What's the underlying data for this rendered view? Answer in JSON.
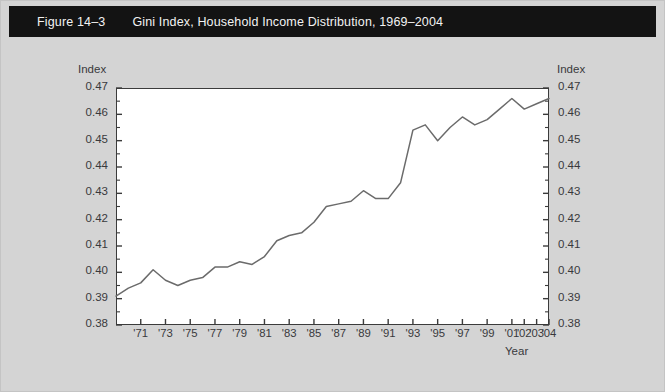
{
  "figure": {
    "number": "Figure 14–3",
    "caption": "Gini Index, Household Income Distribution, 1969–2004",
    "title_bar_color": "#131313",
    "page_background": "#d4d4d4",
    "plot_background": "#ffffff",
    "line_color": "#6b6b6b"
  },
  "axes": {
    "left_label": "Index",
    "right_label": "Index",
    "x_label": "Year",
    "y_tick_labels": [
      "0.47",
      "0.46",
      "0.45",
      "0.44",
      "0.43",
      "0.42",
      "0.41",
      "0.40",
      "0.39",
      "0.38"
    ],
    "x_tick_labels": [
      "'71",
      "'73",
      "'75",
      "'77",
      "'79",
      "'81",
      "'83",
      "'85",
      "'87",
      "'89",
      "'91",
      "'93",
      "'95",
      "'97",
      "'99",
      "'01",
      "'02",
      "'03",
      "'04"
    ]
  },
  "chart_data": {
    "type": "line",
    "title": "Gini Index, Household Income Distribution, 1969–2004",
    "xlabel": "Year",
    "ylabel": "Index",
    "xlim": [
      1969,
      2004
    ],
    "ylim": [
      0.38,
      0.47
    ],
    "ytick_values": [
      0.38,
      0.39,
      0.4,
      0.41,
      0.42,
      0.43,
      0.44,
      0.45,
      0.46,
      0.47
    ],
    "minor_tick_step": 0.005,
    "xtick_years": [
      1971,
      1973,
      1975,
      1977,
      1979,
      1981,
      1983,
      1985,
      1987,
      1989,
      1991,
      1993,
      1995,
      1997,
      1999,
      2001,
      2002,
      2003,
      2004
    ],
    "grid": false,
    "legend": "none",
    "x": [
      1969,
      1970,
      1971,
      1972,
      1973,
      1974,
      1975,
      1976,
      1977,
      1978,
      1979,
      1980,
      1981,
      1982,
      1983,
      1984,
      1985,
      1986,
      1987,
      1988,
      1989,
      1990,
      1991,
      1992,
      1993,
      1994,
      1995,
      1996,
      1997,
      1998,
      1999,
      2000,
      2001,
      2002,
      2003,
      2004
    ],
    "series": [
      {
        "name": "Gini Index",
        "values": [
          0.391,
          0.394,
          0.396,
          0.401,
          0.397,
          0.395,
          0.397,
          0.398,
          0.402,
          0.402,
          0.404,
          0.403,
          0.406,
          0.412,
          0.414,
          0.415,
          0.419,
          0.425,
          0.426,
          0.427,
          0.431,
          0.428,
          0.428,
          0.434,
          0.454,
          0.456,
          0.45,
          0.455,
          0.459,
          0.456,
          0.458,
          0.462,
          0.466,
          0.462,
          0.464,
          0.466
        ]
      }
    ]
  }
}
